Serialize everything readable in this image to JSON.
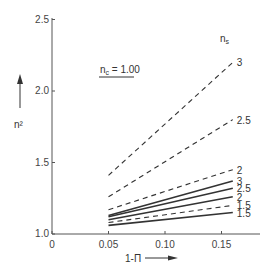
{
  "chart_data": {
    "type": "line",
    "title": "",
    "xlabel": "1-Π",
    "ylabel": "n²",
    "xlim": [
      0,
      0.18
    ],
    "ylim": [
      1.0,
      2.5
    ],
    "x_ticks": [
      "0",
      "0.05",
      "0.10",
      "0.15"
    ],
    "y_ticks": [
      "1.0",
      "1.5",
      "2.0",
      "2.5"
    ],
    "grid": false,
    "annotation": "n_c = 1.00",
    "legend_title": "n_s",
    "x": [
      0.05,
      0.16
    ],
    "series": [
      {
        "name": "3",
        "style": "dashed",
        "values": [
          1.41,
          2.2
        ]
      },
      {
        "name": "2.5",
        "style": "dashed",
        "values": [
          1.26,
          1.8
        ]
      },
      {
        "name": "2",
        "style": "dashed",
        "values": [
          1.17,
          1.45
        ]
      },
      {
        "name": "3",
        "style": "solid",
        "values": [
          1.13,
          1.37
        ]
      },
      {
        "name": "2.5",
        "style": "solid",
        "values": [
          1.12,
          1.32
        ]
      },
      {
        "name": "2",
        "style": "solid",
        "values": [
          1.1,
          1.26
        ]
      },
      {
        "name": "1.5",
        "style": "dashed",
        "values": [
          1.08,
          1.2
        ]
      },
      {
        "name": "1.5",
        "style": "solid",
        "values": [
          1.06,
          1.15
        ]
      }
    ]
  },
  "labels": {
    "y_axis": "n²",
    "x_axis": "1-Π",
    "annotation_nc": "n",
    "annotation_sub": "c",
    "annotation_value": "= 1.00",
    "legend_n": "n",
    "legend_sub": "s"
  }
}
